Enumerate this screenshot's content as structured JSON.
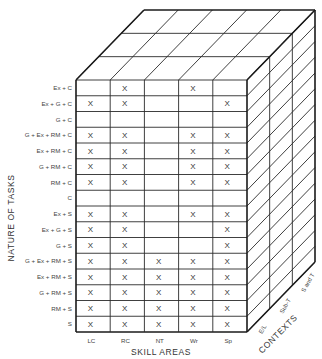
{
  "diagram": {
    "type": "3d-matrix-cube",
    "axes": {
      "y_title": "NATURE OF TASKS",
      "x_title": "SKILL AREAS",
      "z_title": "CONTEXTS"
    },
    "skill_areas": [
      "LC",
      "RC",
      "NT",
      "Wr",
      "Sp"
    ],
    "contexts": [
      "E/L",
      "Sub-T",
      "S and T"
    ],
    "tasks": [
      {
        "label": "Ex + C",
        "marks": [
          0,
          1,
          0,
          1,
          0
        ]
      },
      {
        "label": "Ex + G + C",
        "marks": [
          1,
          1,
          0,
          0,
          1
        ]
      },
      {
        "label": "G + C",
        "marks": [
          0,
          0,
          0,
          0,
          0
        ]
      },
      {
        "label": "G + Ex + RM + C",
        "marks": [
          1,
          1,
          0,
          1,
          1
        ]
      },
      {
        "label": "Ex + RM + C",
        "marks": [
          1,
          1,
          0,
          1,
          1
        ]
      },
      {
        "label": "G + RM + C",
        "marks": [
          1,
          1,
          0,
          1,
          1
        ]
      },
      {
        "label": "RM + C",
        "marks": [
          1,
          1,
          0,
          1,
          1
        ]
      },
      {
        "label": "C",
        "marks": [
          0,
          0,
          0,
          0,
          0
        ]
      },
      {
        "label": "Ex + S",
        "marks": [
          1,
          1,
          0,
          1,
          1
        ]
      },
      {
        "label": "Ex + G + S",
        "marks": [
          1,
          1,
          0,
          0,
          1
        ]
      },
      {
        "label": "G + S",
        "marks": [
          1,
          1,
          0,
          0,
          1
        ]
      },
      {
        "label": "G + Ex + RM + S",
        "marks": [
          1,
          1,
          1,
          1,
          1
        ]
      },
      {
        "label": "Ex + RM + S",
        "marks": [
          1,
          1,
          1,
          1,
          1
        ]
      },
      {
        "label": "G + RM + S",
        "marks": [
          1,
          1,
          1,
          1,
          1
        ]
      },
      {
        "label": "RM + S",
        "marks": [
          1,
          1,
          1,
          1,
          1
        ]
      },
      {
        "label": "S",
        "marks": [
          1,
          1,
          1,
          1,
          1
        ]
      }
    ],
    "mark_symbol": "X"
  }
}
